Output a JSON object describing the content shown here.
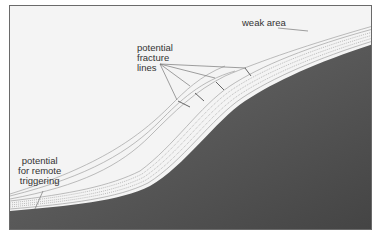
{
  "diagram": {
    "labels": {
      "weak_area": "weak area",
      "fracture_lines": [
        "potential",
        "fracture",
        "lines"
      ],
      "remote_triggering": [
        "potential",
        "for remote",
        "triggering"
      ]
    },
    "colors": {
      "background": "#f4f4f4",
      "ground_dark": "#4a4a4a",
      "ground_light": "#8c8c8c",
      "snow_lines": "#9a9a9a",
      "frame": "#6a6a6a",
      "text": "#333333"
    }
  }
}
